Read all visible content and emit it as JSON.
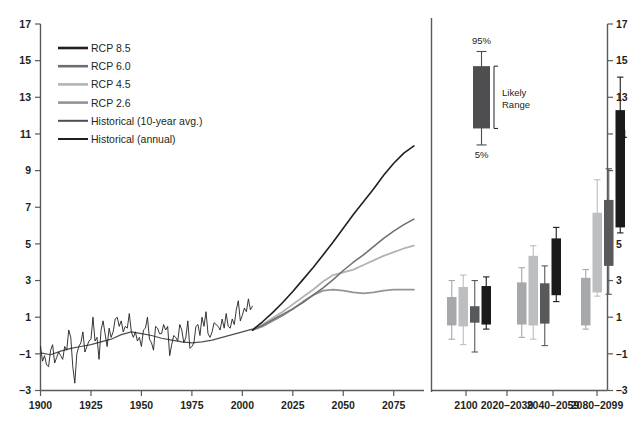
{
  "chart_data": {
    "type": "line",
    "title": "",
    "subtitle": "",
    "panels": [
      {
        "name": "timeseries-panel",
        "type": "line",
        "xlabel": "",
        "ylabel": "",
        "xlim": [
          1900,
          2090
        ],
        "ylim": [
          -3,
          17
        ],
        "xticks": [
          1900,
          1925,
          1950,
          1975,
          2000,
          2025,
          2050,
          2075
        ],
        "yticks": [
          -3,
          -1,
          1,
          3,
          5,
          7,
          9,
          11,
          13,
          15,
          17
        ],
        "grid": false,
        "legend_position": "upper-left",
        "series": [
          {
            "name": "RCP 8.5",
            "color": "#231f20",
            "width": 1.6,
            "x": [
              2005,
              2010,
              2015,
              2020,
              2025,
              2030,
              2035,
              2040,
              2045,
              2050,
              2055,
              2060,
              2065,
              2070,
              2075,
              2080,
              2085
            ],
            "values": [
              0.3,
              0.75,
              1.25,
              1.8,
              2.4,
              3.05,
              3.7,
              4.4,
              5.1,
              5.85,
              6.6,
              7.3,
              8.0,
              8.75,
              9.4,
              9.95,
              10.35
            ]
          },
          {
            "name": "RCP 6.0",
            "color": "#6d6e71",
            "width": 1.5,
            "x": [
              2005,
              2010,
              2015,
              2020,
              2025,
              2030,
              2035,
              2040,
              2045,
              2050,
              2055,
              2060,
              2065,
              2070,
              2075,
              2080,
              2085
            ],
            "values": [
              0.3,
              0.55,
              0.85,
              1.15,
              1.45,
              1.8,
              2.2,
              2.6,
              3.05,
              3.55,
              4.0,
              4.4,
              4.85,
              5.3,
              5.7,
              6.05,
              6.35
            ]
          },
          {
            "name": "RCP 4.5",
            "color": "#b2b3b5",
            "width": 1.8,
            "x": [
              2005,
              2010,
              2015,
              2020,
              2025,
              2030,
              2035,
              2040,
              2045,
              2050,
              2055,
              2060,
              2065,
              2070,
              2075,
              2080,
              2085
            ],
            "values": [
              0.3,
              0.6,
              0.95,
              1.3,
              1.7,
              2.1,
              2.5,
              2.95,
              3.3,
              3.45,
              3.6,
              3.85,
              4.1,
              4.35,
              4.55,
              4.75,
              4.9
            ]
          },
          {
            "name": "RCP 2.6",
            "color": "#929497",
            "width": 1.8,
            "x": [
              2005,
              2010,
              2015,
              2020,
              2025,
              2030,
              2035,
              2040,
              2045,
              2050,
              2055,
              2060,
              2065,
              2070,
              2075,
              2080,
              2085
            ],
            "values": [
              0.3,
              0.5,
              0.8,
              1.1,
              1.45,
              1.85,
              2.2,
              2.45,
              2.5,
              2.45,
              2.35,
              2.3,
              2.35,
              2.45,
              2.5,
              2.5,
              2.5
            ]
          },
          {
            "name": "Historical (10-year avg.)",
            "color": "#4d4e50",
            "width": 1.2,
            "x": [
              1900,
              1905,
              1910,
              1915,
              1920,
              1925,
              1930,
              1935,
              1940,
              1945,
              1950,
              1955,
              1960,
              1965,
              1970,
              1975,
              1980,
              1985,
              1990,
              1995,
              2000,
              2005
            ],
            "values": [
              -0.95,
              -1.05,
              -0.85,
              -0.7,
              -0.6,
              -0.5,
              -0.35,
              -0.2,
              0.05,
              0.2,
              0.1,
              0.0,
              -0.15,
              -0.25,
              -0.35,
              -0.4,
              -0.35,
              -0.25,
              -0.1,
              0.05,
              0.2,
              0.35
            ]
          },
          {
            "name": "Historical (annual)",
            "color": "#231f20",
            "width": 0.9,
            "x": [
              1900,
              1901,
              1902,
              1903,
              1904,
              1905,
              1906,
              1907,
              1908,
              1909,
              1910,
              1911,
              1912,
              1913,
              1914,
              1915,
              1916,
              1917,
              1918,
              1919,
              1920,
              1921,
              1922,
              1923,
              1924,
              1925,
              1926,
              1927,
              1928,
              1929,
              1930,
              1931,
              1932,
              1933,
              1934,
              1935,
              1936,
              1937,
              1938,
              1939,
              1940,
              1941,
              1942,
              1943,
              1944,
              1945,
              1946,
              1947,
              1948,
              1949,
              1950,
              1951,
              1952,
              1953,
              1954,
              1955,
              1956,
              1957,
              1958,
              1959,
              1960,
              1961,
              1962,
              1963,
              1964,
              1965,
              1966,
              1967,
              1968,
              1969,
              1970,
              1971,
              1972,
              1973,
              1974,
              1975,
              1976,
              1977,
              1978,
              1979,
              1980,
              1981,
              1982,
              1983,
              1984,
              1985,
              1986,
              1987,
              1988,
              1989,
              1990,
              1991,
              1992,
              1993,
              1994,
              1995,
              1996,
              1997,
              1998,
              1999,
              2000,
              2001,
              2002,
              2003,
              2004,
              2005
            ],
            "values": [
              -0.6,
              -1.4,
              -1.1,
              -1.6,
              -1.7,
              -0.8,
              -0.5,
              -1.5,
              -1.2,
              -0.9,
              -1.1,
              -1.3,
              -0.6,
              -0.8,
              0.3,
              -0.1,
              -1.7,
              -2.6,
              -1.0,
              -0.6,
              -0.4,
              0.2,
              -0.9,
              -0.6,
              -0.3,
              -0.2,
              1.0,
              -0.3,
              -0.1,
              -1.3,
              0.3,
              0.8,
              0.1,
              -0.6,
              0.4,
              -0.1,
              0.2,
              0.9,
              1.0,
              0.5,
              0.8,
              0.2,
              0.5,
              0.4,
              1.2,
              0.2,
              -0.1,
              0.2,
              -0.3,
              -0.1,
              -0.6,
              0.3,
              0.4,
              1.0,
              -0.2,
              -0.4,
              -0.8,
              0.5,
              0.4,
              0.1,
              0.1,
              0.6,
              0.3,
              0.5,
              -1.1,
              -0.5,
              0.0,
              -0.1,
              -0.3,
              0.6,
              0.3,
              -0.4,
              -0.1,
              0.8,
              -0.7,
              -0.6,
              -0.4,
              0.5,
              0.6,
              0.0,
              1.0,
              0.5,
              1.3,
              0.1,
              -0.1,
              0.2,
              0.7,
              0.6,
              0.5,
              0.3,
              0.9,
              0.4,
              1.2,
              0.5,
              0.4,
              0.9,
              0.6,
              1.4,
              1.9,
              0.8,
              1.1,
              1.5,
              1.3,
              2.0,
              1.4,
              1.6
            ]
          }
        ]
      },
      {
        "name": "likely-range-panel",
        "type": "bar",
        "xlabel": "",
        "ylabel": "",
        "ylim": [
          -3,
          17
        ],
        "yticks": [
          -3,
          -1,
          1,
          3,
          5,
          7,
          9,
          11,
          13,
          15,
          17
        ],
        "grid": false,
        "categories": [
          "2100",
          "2020–2039",
          "2040–2059",
          "2080–2099"
        ],
        "inset": {
          "name": "likely-range-key",
          "upper_label": "95%",
          "lower_label": "5%",
          "range_label_line1": "Likely",
          "range_label_line2": "Range",
          "box_low": 11.3,
          "box_high": 14.7,
          "whisker_low": 10.4,
          "whisker_high": 15.5,
          "color": "#4d4e50"
        },
        "groups": [
          {
            "label": "2100",
            "bars": [
              {
                "scenario": "RCP 2.6",
                "color": "#a6a8ab",
                "box_low": 0.55,
                "box_high": 2.1,
                "whisker_low": -0.2,
                "whisker_high": 3.0
              },
              {
                "scenario": "RCP 4.5",
                "color": "#bcbec0",
                "box_low": 0.5,
                "box_high": 2.65,
                "whisker_low": -0.5,
                "whisker_high": 3.3
              },
              {
                "scenario": "RCP 6.0",
                "color": "#58595b",
                "box_low": 0.7,
                "box_high": 1.6,
                "whisker_low": -0.9,
                "whisker_high": 3.0
              },
              {
                "scenario": "RCP 8.5",
                "color": "#1a1a1a",
                "box_low": 0.6,
                "box_high": 2.7,
                "whisker_low": 0.35,
                "whisker_high": 3.2
              }
            ]
          },
          {
            "label": "2020–2039",
            "bars": [
              {
                "scenario": "RCP 2.6",
                "color": "#a6a8ab",
                "box_low": 0.6,
                "box_high": 2.9,
                "whisker_low": -0.1,
                "whisker_high": 3.7
              },
              {
                "scenario": "RCP 4.5",
                "color": "#bcbec0",
                "box_low": 0.55,
                "box_high": 4.35,
                "whisker_low": -0.2,
                "whisker_high": 4.9
              },
              {
                "scenario": "RCP 6.0",
                "color": "#58595b",
                "box_low": 0.65,
                "box_high": 2.85,
                "whisker_low": -0.55,
                "whisker_high": 3.8
              },
              {
                "scenario": "RCP 8.5",
                "color": "#1a1a1a",
                "box_low": 2.2,
                "box_high": 5.3,
                "whisker_low": 1.85,
                "whisker_high": 5.9
              }
            ]
          },
          {
            "label": "2040–2059",
            "bars": [
              {
                "scenario": "RCP 2.6",
                "color": "#a6a8ab",
                "box_low": 0.55,
                "box_high": 3.15,
                "whisker_low": 0.35,
                "whisker_high": 3.6
              },
              {
                "scenario": "RCP 4.5",
                "color": "#bcbec0",
                "box_low": 2.35,
                "box_high": 6.7,
                "whisker_low": 2.15,
                "whisker_high": 8.5
              },
              {
                "scenario": "RCP 6.0",
                "color": "#58595b",
                "box_low": 3.8,
                "box_high": 7.4,
                "whisker_low": 2.25,
                "whisker_high": 9.1
              },
              {
                "scenario": "RCP 8.5",
                "color": "#1a1a1a",
                "box_low": 5.9,
                "box_high": 12.3,
                "whisker_low": 5.6,
                "whisker_high": 14.1
              }
            ]
          }
        ]
      }
    ]
  },
  "legend": {
    "items": [
      {
        "label": "RCP 8.5",
        "color": "#231f20",
        "width": 2.6
      },
      {
        "label": "RCP 6.0",
        "color": "#6d6e71",
        "width": 2.6
      },
      {
        "label": "RCP 4.5",
        "color": "#b2b3b5",
        "width": 2.6
      },
      {
        "label": "RCP 2.6",
        "color": "#929497",
        "width": 2.6
      },
      {
        "label": "Historical (10-year avg.)",
        "color": "#4d4e50",
        "width": 2.0
      },
      {
        "label": "Historical (annual)",
        "color": "#231f20",
        "width": 2.0
      }
    ]
  },
  "left_axis": {
    "yticks": [
      "17",
      "15",
      "13",
      "11",
      "9",
      "7",
      "5",
      "3",
      "1",
      "–1",
      "–3"
    ],
    "xticks": [
      "1900",
      "1925",
      "1950",
      "1975",
      "2000",
      "2025",
      "2050",
      "2075"
    ]
  },
  "right_axis": {
    "yticks": [
      "17",
      "15",
      "13",
      "11",
      "9",
      "7",
      "5",
      "3",
      "1",
      "–1",
      "–3"
    ],
    "xticks": [
      "2100",
      "2020–2039",
      "2040–2059",
      "2080–2099"
    ]
  },
  "inset_key": {
    "upper": "95%",
    "lower": "5%",
    "line1": "Likely",
    "line2": "Range"
  },
  "colors": {
    "axis": "#58595b",
    "text": "#231f20",
    "background": "#ffffff"
  }
}
